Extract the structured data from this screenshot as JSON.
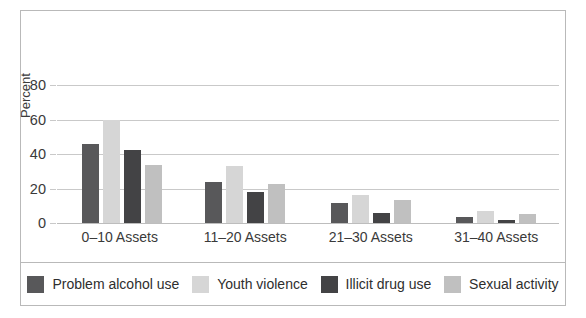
{
  "chart_data": {
    "type": "bar",
    "title": "",
    "subtitle": "",
    "xlabel": "",
    "ylabel": "Percent",
    "ylim": [
      0,
      90
    ],
    "yticks": [
      0,
      20,
      40,
      60,
      80
    ],
    "ytick_labels": [
      "0",
      "20",
      "40",
      "60",
      "80"
    ],
    "grid": true,
    "grid_axis": "y",
    "legend_position": "bottom",
    "categories": [
      "0–10 Assets",
      "11–20 Assets",
      "21–30 Assets",
      "31–40 Assets"
    ],
    "series": [
      {
        "name": "Problem alcohol use",
        "color": "#58585a",
        "values": [
          46,
          24,
          11.5,
          3.5
        ]
      },
      {
        "name": "Youth violence",
        "color": "#d6d6d6",
        "values": [
          60,
          33,
          16.5,
          7
        ]
      },
      {
        "name": "Illicit drug use",
        "color": "#434345",
        "values": [
          42.5,
          18,
          6,
          2
        ]
      },
      {
        "name": "Sexual activity",
        "color": "#c0c0c0",
        "values": [
          33.5,
          22.5,
          13.5,
          5.5
        ]
      }
    ]
  },
  "legend": {
    "items": [
      {
        "label": "Problem alcohol use"
      },
      {
        "label": "Youth violence"
      },
      {
        "label": "Illicit drug use"
      },
      {
        "label": "Sexual activity"
      }
    ]
  },
  "axis": {
    "y_label": "Percent"
  }
}
